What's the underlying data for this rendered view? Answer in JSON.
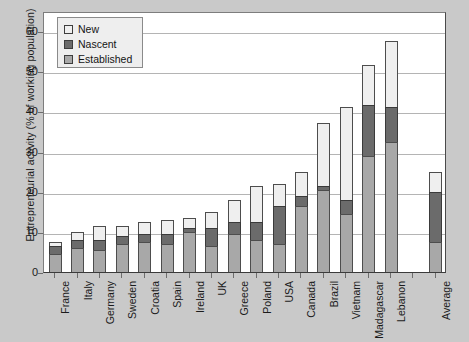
{
  "chart_data": {
    "type": "bar",
    "stacked": true,
    "title": "",
    "xlabel": "",
    "ylabel": "Entrepreneurial activity (% of working population)",
    "ylim": [
      0,
      65
    ],
    "yticks": [
      0,
      10,
      20,
      30,
      40,
      50,
      60
    ],
    "grid": true,
    "legend_position": "top-left",
    "legend": [
      "New",
      "Nascent",
      "Established"
    ],
    "categories": [
      "France",
      "Italy",
      "Germany",
      "Sweden",
      "Croatia",
      "Spain",
      "Ireland",
      "UK",
      "Greece",
      "Poland",
      "USA",
      "Canada",
      "Brazil",
      "Vietnam",
      "Madagascar",
      "Lebanon",
      "",
      "Average"
    ],
    "series": [
      {
        "name": "Established",
        "color": "#a8a8a8",
        "values": [
          4.5,
          6.0,
          5.5,
          7.0,
          7.5,
          7.0,
          10.0,
          6.5,
          9.5,
          8.0,
          7.0,
          16.5,
          20.5,
          14.5,
          29.0,
          32.5,
          null,
          7.5
        ]
      },
      {
        "name": "Nascent",
        "color": "#6b6b6b",
        "values": [
          2.0,
          2.0,
          2.5,
          2.0,
          2.0,
          2.5,
          1.0,
          4.5,
          3.0,
          4.5,
          9.5,
          2.5,
          1.0,
          3.5,
          12.5,
          8.5,
          null,
          12.5
        ]
      },
      {
        "name": "New",
        "color": "#efefef",
        "values": [
          1.0,
          2.0,
          3.5,
          2.5,
          3.0,
          3.5,
          2.5,
          4.0,
          5.5,
          9.0,
          5.5,
          6.0,
          15.5,
          23.0,
          10.0,
          16.5,
          null,
          5.0
        ]
      }
    ],
    "totals": [
      7.5,
      10.0,
      11.5,
      11.5,
      12.5,
      13.0,
      13.5,
      15.0,
      18.0,
      21.5,
      22.0,
      25.0,
      37.0,
      41.5,
      51.5,
      57.5,
      null,
      25.0
    ]
  },
  "axis": {
    "y_title": "Entrepreneurial activity (% of working population)",
    "y_tick_labels": [
      "0",
      "10",
      "20",
      "30",
      "40",
      "50",
      "60"
    ]
  },
  "legend": {
    "items": [
      {
        "label": "New",
        "color": "#efefef"
      },
      {
        "label": "Nascent",
        "color": "#6b6b6b"
      },
      {
        "label": "Established",
        "color": "#a8a8a8"
      }
    ]
  }
}
